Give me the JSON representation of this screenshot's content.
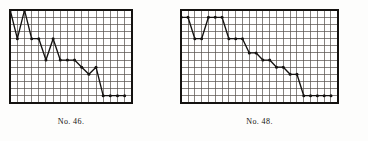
{
  "page": {
    "background_color": "#fdfdfc",
    "ink_color": "#141210",
    "grid_color": "#4a4540"
  },
  "figures": [
    {
      "id": "fig-46",
      "caption": "No. 46.",
      "frame": {
        "x": 9,
        "y": 9,
        "width": 124,
        "height": 95
      }
    },
    {
      "id": "fig-48",
      "caption": "No. 48.",
      "frame": {
        "x": 180,
        "y": 9,
        "width": 159,
        "height": 95
      }
    }
  ],
  "chart_data": [
    {
      "type": "line",
      "title": "No. 46.",
      "xlabel": "",
      "ylabel": "",
      "grid": true,
      "legend": "none",
      "marker": "filled-circle",
      "grid_columns": 17,
      "grid_rows": 13,
      "xlim": [
        0,
        17
      ],
      "ylim": [
        0,
        13
      ],
      "x": [
        0,
        1,
        2,
        3,
        4,
        5,
        6,
        7,
        8,
        9,
        10,
        11,
        12,
        13,
        14,
        15,
        16
      ],
      "values": [
        13,
        9,
        13,
        9,
        9,
        6,
        9,
        6,
        6,
        6,
        5,
        4,
        5,
        1,
        1,
        1,
        1
      ],
      "series": [
        {
          "name": "No. 46 curve",
          "values": [
            13,
            9,
            13,
            9,
            9,
            6,
            9,
            6,
            6,
            6,
            5,
            4,
            5,
            1,
            1,
            1,
            1
          ]
        }
      ]
    },
    {
      "type": "line",
      "title": "No. 48.",
      "xlabel": "",
      "ylabel": "",
      "grid": true,
      "legend": "none",
      "marker": "filled-circle",
      "grid_columns": 23,
      "grid_rows": 13,
      "xlim": [
        0,
        23
      ],
      "ylim": [
        0,
        13
      ],
      "x": [
        0,
        1,
        2,
        3,
        4,
        5,
        6,
        7,
        8,
        9,
        10,
        11,
        12,
        13,
        14,
        15,
        16,
        17,
        18,
        19,
        20,
        21,
        22
      ],
      "values": [
        12,
        12,
        9,
        9,
        12,
        12,
        12,
        9,
        9,
        9,
        7,
        7,
        6,
        6,
        5,
        5,
        4,
        4,
        1,
        1,
        1,
        1,
        1
      ],
      "series": [
        {
          "name": "No. 48 curve",
          "values": [
            12,
            12,
            9,
            9,
            12,
            12,
            12,
            9,
            9,
            9,
            7,
            7,
            6,
            6,
            5,
            5,
            4,
            4,
            1,
            1,
            1,
            1,
            1
          ]
        }
      ]
    }
  ]
}
